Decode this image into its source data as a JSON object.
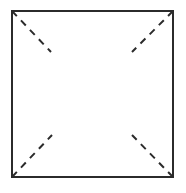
{
  "diagram": {
    "type": "square-with-dashed-corner-diagonals",
    "stroke_color": "#2b2b2b",
    "background": "#ffffff",
    "square": {
      "x1": 12,
      "y1": 11,
      "x2": 173,
      "y2": 177
    },
    "diagonals": [
      {
        "name": "top-left",
        "from": [
          12,
          11
        ],
        "to": [
          51,
          52
        ]
      },
      {
        "name": "top-right",
        "from": [
          173,
          11
        ],
        "to": [
          132,
          52
        ]
      },
      {
        "name": "bottom-left",
        "from": [
          12,
          177
        ],
        "to": [
          52,
          135
        ]
      },
      {
        "name": "bottom-right",
        "from": [
          173,
          177
        ],
        "to": [
          132,
          135
        ]
      }
    ]
  }
}
